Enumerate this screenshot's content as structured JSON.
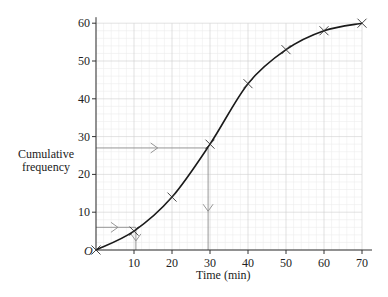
{
  "chart_data": {
    "type": "line",
    "title": "",
    "xlabel": "Time (min)",
    "ylabel": "Cumulative frequency",
    "origin_label": "O",
    "x": [
      0,
      10,
      20,
      30,
      40,
      50,
      60,
      70
    ],
    "series": [
      {
        "name": "Cumulative frequency curve",
        "values": [
          0,
          5,
          14,
          28,
          44,
          53,
          58,
          60
        ],
        "marker": "x",
        "smooth": true
      }
    ],
    "x_ticks": [
      "10",
      "20",
      "30",
      "40",
      "50",
      "60",
      "70"
    ],
    "y_ticks": [
      "10",
      "20",
      "30",
      "40",
      "50",
      "60"
    ],
    "xlim": [
      0,
      70
    ],
    "ylim": [
      0,
      60
    ],
    "grid": true,
    "guide_lines": [
      {
        "from_y": 6,
        "to_x": 10.5,
        "arrows": "right-then-down"
      },
      {
        "from_y": 27,
        "to_x": 29.5,
        "arrows": "right-then-down"
      }
    ],
    "colors": {
      "curve": "#1a1a1a",
      "grid_major": "#cfcfcf",
      "grid_minor": "#ececec",
      "guide": "#8a8a8a",
      "axis": "#333333"
    }
  }
}
